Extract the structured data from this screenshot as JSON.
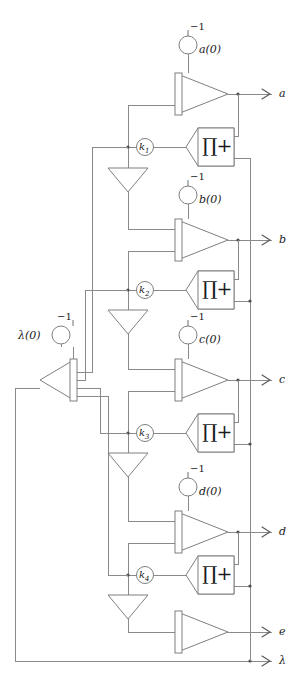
{
  "diagram": {
    "type": "signal-flow-schematic",
    "colors": {
      "wire": "#888a8c",
      "shape_stroke": "#7d7f81",
      "shape_fill": "#ffffff",
      "junction": "#4a4c4e",
      "text": "#1b1b1b",
      "background": "#ffffff"
    },
    "outputs": [
      {
        "label": "a",
        "y": 94
      },
      {
        "label": "b",
        "y": 240
      },
      {
        "label": "c",
        "y": 380
      },
      {
        "label": "d",
        "y": 532
      },
      {
        "label": "e",
        "y": 632
      },
      {
        "label": "λ",
        "y": 661
      }
    ],
    "initial_conditions": [
      {
        "label": "a(0)",
        "sign": "−1",
        "cx": 188,
        "cy": 45
      },
      {
        "label": "b(0)",
        "sign": "−1",
        "cx": 188,
        "cy": 195
      },
      {
        "label": "c(0)",
        "sign": "−1",
        "cx": 188,
        "cy": 335
      },
      {
        "label": "d(0)",
        "sign": "−1",
        "cx": 188,
        "cy": 487
      },
      {
        "label": "λ(0)",
        "sign": "−1",
        "cx": 61,
        "cy": 335
      }
    ],
    "gains": [
      {
        "label": "k",
        "sub": "1",
        "cx": 145,
        "cy": 147
      },
      {
        "label": "k",
        "sub": "2",
        "cx": 145,
        "cy": 290
      },
      {
        "label": "k",
        "sub": "3",
        "cx": 145,
        "cy": 433
      },
      {
        "label": "k",
        "sub": "4",
        "cx": 145,
        "cy": 575
      }
    ],
    "product_blocks": [
      {
        "symbol": "∏+",
        "cx": 210,
        "cy": 147
      },
      {
        "symbol": "∏+",
        "cx": 210,
        "cy": 290
      },
      {
        "symbol": "∏+",
        "cx": 210,
        "cy": 433
      },
      {
        "symbol": "∏+",
        "cx": 210,
        "cy": 575
      }
    ],
    "integrators": [
      {
        "name": "integrator-a",
        "x": 188,
        "y": 94
      },
      {
        "name": "integrator-b",
        "x": 188,
        "y": 240
      },
      {
        "name": "integrator-c",
        "x": 188,
        "y": 380
      },
      {
        "name": "integrator-d",
        "x": 188,
        "y": 532
      },
      {
        "name": "integrator-e",
        "x": 188,
        "y": 632
      },
      {
        "name": "integrator-lambda",
        "x": 61,
        "y": 380
      }
    ],
    "inverters": [
      {
        "name": "inverter-1",
        "cx": 128,
        "cy": 180
      },
      {
        "name": "inverter-2",
        "cx": 128,
        "cy": 322
      },
      {
        "name": "inverter-3",
        "cx": 128,
        "cy": 465
      },
      {
        "name": "inverter-4",
        "cx": 128,
        "cy": 607
      }
    ]
  }
}
